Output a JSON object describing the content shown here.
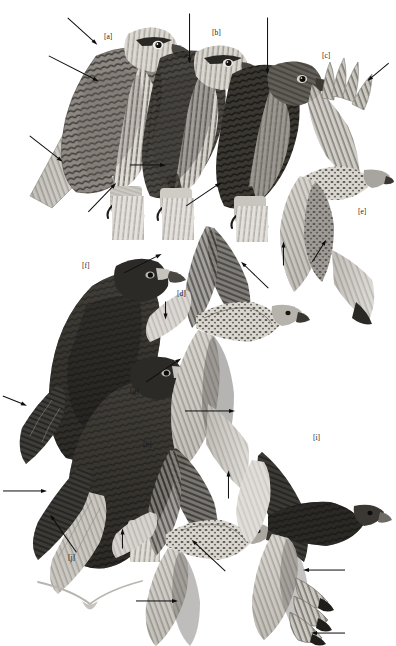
{
  "plate": {
    "title": "Raptor plumage comparison plate",
    "subject": "Buteo hawks - perched and flight illustrations",
    "background_color": "#ffffff",
    "ink_color": "#0d0d0d",
    "width": 396,
    "height": 646,
    "rendering": "grayscale halftone illustration"
  },
  "labels": [
    {
      "id": "a",
      "text": "[a]",
      "x": 104,
      "y": 33,
      "subject": "perched-hawk-pale-morph-left"
    },
    {
      "id": "b",
      "text": "[b]",
      "x": 212,
      "y": 29,
      "subject": "perched-hawk-middle"
    },
    {
      "id": "c",
      "text": "[c]",
      "x": 322,
      "y": 52,
      "subject": "perched-hawk-dark-right"
    },
    {
      "id": "d",
      "text": "[d]",
      "x": 177,
      "y": 290,
      "subject": "flight-hawk-underwing-center"
    },
    {
      "id": "e",
      "text": "[e]",
      "x": 358,
      "y": 208,
      "subject": "flight-hawk-upper-right"
    },
    {
      "id": "f",
      "text": "[f]",
      "x": 82,
      "y": 262,
      "subject": "perched-dark-morph-upper"
    },
    {
      "id": "g",
      "text": "[g]",
      "x": 130,
      "y": 388,
      "subject": "perched-dark-morph-lower"
    },
    {
      "id": "h",
      "text": "[h]",
      "x": 143,
      "y": 441,
      "subject": "flight-hawk-lower-center"
    },
    {
      "id": "i",
      "text": "[i]",
      "x": 313,
      "y": 434,
      "subject": "flight-hawk-dark-lower-right"
    },
    {
      "id": "j",
      "text": "[j]",
      "x": 68,
      "y": 554,
      "subject": "perched-dark-morph-tail"
    }
  ],
  "arrows": [
    {
      "name": "arrow-to-supercilium-a",
      "x": 68,
      "y": 14,
      "length": 40,
      "angle": 42,
      "points_to": "head-stripe of [a]"
    },
    {
      "name": "arrow-to-upperwing-a",
      "x": 49,
      "y": 52,
      "length": 56,
      "angle": 27,
      "points_to": "scapulars of [a]"
    },
    {
      "name": "arrow-to-tail-a",
      "x": 30,
      "y": 132,
      "length": 42,
      "angle": 38,
      "points_to": "tail base of [a]"
    },
    {
      "name": "arrow-to-breastband-b",
      "x": 190,
      "y": 10,
      "length": 50,
      "angle": 90,
      "points_to": "breast of [b]"
    },
    {
      "name": "arrow-to-tarsus-b",
      "x": 130,
      "y": 161,
      "length": 36,
      "angle": 0,
      "points_to": "leg feathering of [b]"
    },
    {
      "name": "arrow-to-breast-c",
      "x": 268,
      "y": 14,
      "length": 57,
      "angle": 90,
      "points_to": "breast of [c]"
    },
    {
      "name": "arrow-to-tarsus-c",
      "x": 186,
      "y": 202,
      "length": 42,
      "angle": -34,
      "points_to": "leg feathering of [c]"
    },
    {
      "name": "arrow-to-leg-a",
      "x": 88,
      "y": 208,
      "length": 40,
      "angle": -46,
      "points_to": "tarsus of [a]"
    },
    {
      "name": "arrow-to-primaries-e",
      "x": 389,
      "y": 60,
      "length": 28,
      "angle": 140,
      "points_to": "outer primaries of [e]"
    },
    {
      "name": "arrow-to-underwing-e",
      "x": 283,
      "y": 262,
      "length": 24,
      "angle": -90,
      "points_to": "underwing coverts of [e]"
    },
    {
      "name": "arrow-to-patagial-e",
      "x": 312,
      "y": 258,
      "length": 26,
      "angle": -58,
      "points_to": "patagial mark of [e]"
    },
    {
      "name": "arrow-from-f-bill",
      "x": 124,
      "y": 269,
      "length": 42,
      "angle": -27,
      "points_to": "cere and bill of [f]"
    },
    {
      "name": "arrow-to-d-wingtip",
      "x": 166,
      "y": 298,
      "length": 18,
      "angle": 90,
      "points_to": "secondary of [d]"
    },
    {
      "name": "arrow-to-d-patagial",
      "x": 268,
      "y": 285,
      "length": 38,
      "angle": -136,
      "points_to": "patagial bar of [d]"
    },
    {
      "name": "arrow-from-g-bill",
      "x": 146,
      "y": 378,
      "length": 42,
      "angle": -34,
      "points_to": "cere and bill of [g]"
    },
    {
      "name": "arrow-to-f-wingtip",
      "x": 3,
      "y": 392,
      "length": 26,
      "angle": 22,
      "points_to": "primary tips of [f]"
    },
    {
      "name": "arrow-to-d-bellyband",
      "x": 185,
      "y": 407,
      "length": 50,
      "angle": 0,
      "points_to": "belly band of [d]"
    },
    {
      "name": "arrow-to-j-uppertail",
      "x": 3,
      "y": 487,
      "length": 44,
      "angle": 0,
      "points_to": "uppertail of [j]"
    },
    {
      "name": "arrow-to-j-tailtip",
      "x": 76,
      "y": 549,
      "length": 46,
      "angle": -125,
      "points_to": "tail tip of [j]"
    },
    {
      "name": "arrow-to-h-wrist",
      "x": 122,
      "y": 545,
      "length": 20,
      "angle": -90,
      "points_to": "wrist of [h]"
    },
    {
      "name": "arrow-to-h-body",
      "x": 225,
      "y": 568,
      "length": 46,
      "angle": -137,
      "points_to": "belly of [h]"
    },
    {
      "name": "arrow-to-h-trailingedge",
      "x": 136,
      "y": 597,
      "length": 42,
      "angle": 0,
      "points_to": "trailing edge of [h]"
    },
    {
      "name": "arrow-to-i-tail",
      "x": 228,
      "y": 495,
      "length": 28,
      "angle": -90,
      "points_to": "tail of [i]"
    },
    {
      "name": "arrow-to-i-secondaries",
      "x": 345,
      "y": 567,
      "length": 42,
      "angle": 180,
      "points_to": "secondaries of [i]"
    },
    {
      "name": "arrow-to-i-primarytips",
      "x": 345,
      "y": 630,
      "length": 34,
      "angle": 180,
      "points_to": "primary tips of [i]"
    }
  ],
  "figures": [
    {
      "id": "a",
      "name": "perched-hawk-a",
      "pose": "perched",
      "facing": "right",
      "tone": "pale-morph"
    },
    {
      "id": "b",
      "name": "perched-hawk-b",
      "pose": "perched",
      "facing": "right",
      "tone": "intermediate"
    },
    {
      "id": "c",
      "name": "perched-hawk-c",
      "pose": "perched",
      "facing": "right",
      "tone": "dark"
    },
    {
      "id": "d",
      "name": "flight-hawk-d",
      "pose": "flight-underside",
      "facing": "right",
      "tone": "pale"
    },
    {
      "id": "e",
      "name": "flight-hawk-e",
      "pose": "flight-underside",
      "facing": "right",
      "tone": "pale"
    },
    {
      "id": "f",
      "name": "perched-darkmorph-f",
      "pose": "perched",
      "facing": "right",
      "tone": "very-dark"
    },
    {
      "id": "g",
      "name": "perched-darkmorph-g",
      "pose": "perched",
      "facing": "right",
      "tone": "very-dark"
    },
    {
      "id": "h",
      "name": "flight-hawk-h",
      "pose": "flight-underside",
      "facing": "right",
      "tone": "rufous-dark"
    },
    {
      "id": "i",
      "name": "flight-hawk-i",
      "pose": "flight-underside",
      "facing": "right",
      "tone": "dark-morph"
    },
    {
      "id": "j",
      "name": "perched-darkmorph-tail-j",
      "pose": "perched-tail-detail",
      "facing": "right",
      "tone": "very-dark"
    }
  ],
  "silhouette": {
    "name": "soaring-dihedral-silhouette",
    "x": 38,
    "y": 578,
    "width": 112,
    "height": 34,
    "color": "#b9b9b9",
    "description": "head-on soaring silhouette showing dihedral wing posture"
  }
}
